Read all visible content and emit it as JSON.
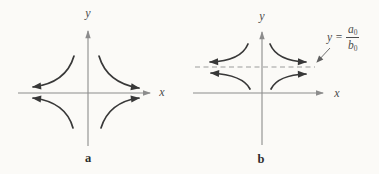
{
  "figure": {
    "colors": {
      "background": "#fbfaf7",
      "curve": "#383838",
      "axis": "#8c8c8c",
      "dashed_line": "#9c9c9c",
      "text": "#4c4c4c"
    }
  },
  "panel_a": {
    "caption": "a",
    "x_label": "x",
    "y_label": "y"
  },
  "panel_b": {
    "caption": "b",
    "x_label": "x",
    "y_label": "y",
    "asymptote": {
      "var": "y",
      "eq": "=",
      "num": "a",
      "num_sub": "0",
      "den": "b",
      "den_sub": "0"
    }
  }
}
